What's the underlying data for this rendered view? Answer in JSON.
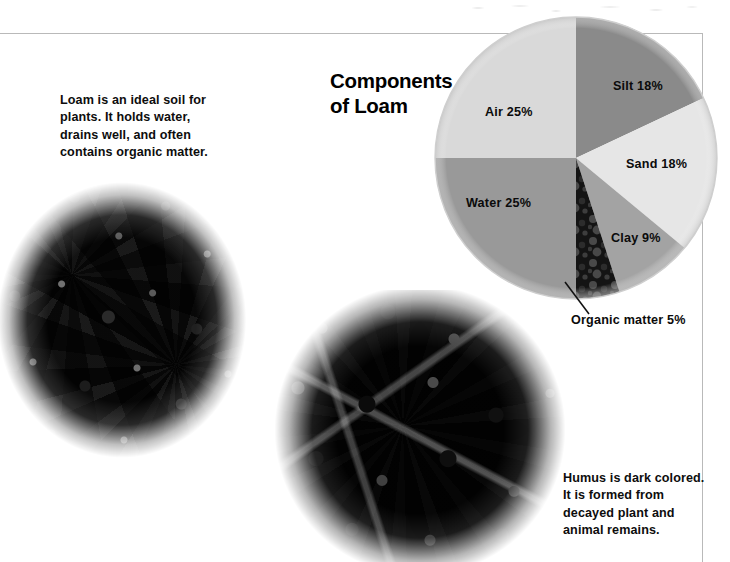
{
  "page": {
    "background_color": "#ffffff",
    "rule_color": "#b9b9b9"
  },
  "intro": {
    "text": "Loam is an ideal soil for\nplants. It holds water,\ndrains well, and often\ncontains organic matter."
  },
  "humus_caption": {
    "text": "Humus is dark colored.\nIt is formed from\ndecayed plant and\nanimal remains."
  },
  "photos": [
    {
      "name": "loam-soil-photograph",
      "alt": "Crumbly gray-brown loam soil pile"
    },
    {
      "name": "humus-soil-photograph",
      "alt": "Dark chunky humus soil pile"
    }
  ],
  "chart_data": {
    "type": "pie",
    "title": "Components\nof Loam",
    "title_plain": "Components of Loam",
    "xlabel": "",
    "ylabel": "",
    "legend": "none",
    "grid": false,
    "start_angle_deg": 0,
    "direction": "clockwise",
    "center": {
      "x": 576,
      "y": 158
    },
    "radius": 142,
    "categories": [
      "Silt",
      "Sand",
      "Clay",
      "Organic matter",
      "Water",
      "Air"
    ],
    "values": [
      18,
      18,
      9,
      5,
      25,
      25
    ],
    "unit": "%",
    "labels": [
      "Silt 18%",
      "Sand 18%",
      "Clay 9%",
      "Organic matter 5%",
      "Water 25%",
      "Air 25%"
    ],
    "colors": [
      "#8a8a8a",
      "#e6e6e6",
      "#a3a3a3",
      "#1d1d1d",
      "#999999",
      "#d9d9d9"
    ],
    "slices": [
      {
        "label": "Silt 18%",
        "name": "Silt",
        "value": 18,
        "color": "#8a8a8a",
        "textured": false
      },
      {
        "label": "Sand 18%",
        "name": "Sand",
        "value": 18,
        "color": "#e6e6e6",
        "textured": false
      },
      {
        "label": "Clay 9%",
        "name": "Clay",
        "value": 9,
        "color": "#a3a3a3",
        "textured": false
      },
      {
        "label": "Organic matter 5%",
        "name": "Organic matter",
        "value": 5,
        "color": "#1d1d1d",
        "textured": true
      },
      {
        "label": "Water 25%",
        "name": "Water",
        "value": 25,
        "color": "#999999",
        "textured": false
      },
      {
        "label": "Air 25%",
        "name": "Air",
        "value": 25,
        "color": "#d9d9d9",
        "textured": false
      }
    ],
    "annotations": [
      {
        "text": "Organic matter 5%",
        "leader_line": true
      }
    ]
  }
}
